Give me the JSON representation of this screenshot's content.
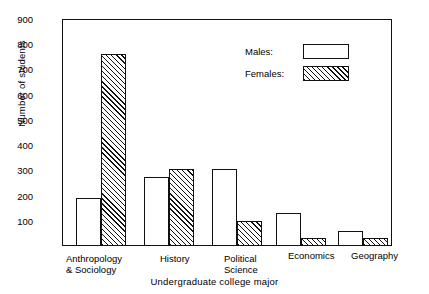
{
  "chart_data": {
    "type": "bar",
    "title": "",
    "xlabel": "Undergraduate college major",
    "ylabel": "Number of students",
    "categories": [
      "Anthropology & Sociology",
      "History",
      "Political Science",
      "Economics",
      "Geography"
    ],
    "category_lines": [
      [
        "Anthropology",
        "& Sociology"
      ],
      [
        "History",
        ""
      ],
      [
        "Political",
        "Science"
      ],
      [
        "Economics",
        ""
      ],
      [
        "Geography",
        ""
      ]
    ],
    "series": [
      {
        "name": "Males:",
        "style": "open",
        "values": [
          190,
          275,
          305,
          130,
          60
        ]
      },
      {
        "name": "Females:",
        "style": "hatched",
        "values": [
          760,
          305,
          100,
          30,
          30
        ]
      }
    ],
    "ylim": [
      0,
      900
    ],
    "yticks": [
      100,
      200,
      300,
      400,
      500,
      600,
      700,
      800,
      900
    ],
    "ytick_labels": [
      "100",
      "200",
      "300",
      "400",
      "500",
      "600",
      "700",
      "800",
      "900"
    ],
    "grid": false,
    "legend_position": "upper right",
    "colors": {
      "bar_outline": "#111111",
      "background": "#ffffff"
    }
  },
  "legend": {
    "entries": [
      {
        "label": "Males:",
        "swatch": "open-box"
      },
      {
        "label": "Females:",
        "swatch": "hatched-box"
      }
    ]
  }
}
